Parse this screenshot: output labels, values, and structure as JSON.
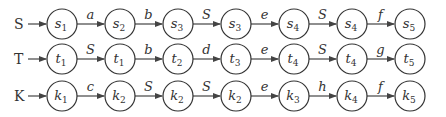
{
  "diagram": {
    "rows": [
      {
        "label": "S",
        "nodes": [
          {
            "base": "s",
            "sub": "1"
          },
          {
            "base": "s",
            "sub": "2"
          },
          {
            "base": "s",
            "sub": "3"
          },
          {
            "base": "s",
            "sub": "3"
          },
          {
            "base": "s",
            "sub": "4"
          },
          {
            "base": "s",
            "sub": "4"
          },
          {
            "base": "s",
            "sub": "5"
          }
        ],
        "edges": [
          "a",
          "b",
          "S",
          "e",
          "S",
          "f"
        ]
      },
      {
        "label": "T",
        "nodes": [
          {
            "base": "t",
            "sub": "1"
          },
          {
            "base": "t",
            "sub": "1"
          },
          {
            "base": "t",
            "sub": "2"
          },
          {
            "base": "t",
            "sub": "3"
          },
          {
            "base": "t",
            "sub": "4"
          },
          {
            "base": "t",
            "sub": "4"
          },
          {
            "base": "t",
            "sub": "5"
          }
        ],
        "edges": [
          "S",
          "b",
          "d",
          "e",
          "S",
          "g"
        ]
      },
      {
        "label": "K",
        "nodes": [
          {
            "base": "k",
            "sub": "1"
          },
          {
            "base": "k",
            "sub": "2"
          },
          {
            "base": "k",
            "sub": "2"
          },
          {
            "base": "k",
            "sub": "2"
          },
          {
            "base": "k",
            "sub": "3"
          },
          {
            "base": "k",
            "sub": "4"
          },
          {
            "base": "k",
            "sub": "5"
          }
        ],
        "edges": [
          "c",
          "S",
          "S",
          "e",
          "h",
          "f"
        ]
      }
    ],
    "colors": {
      "stroke": "#333333",
      "background": "#ffffff"
    }
  }
}
